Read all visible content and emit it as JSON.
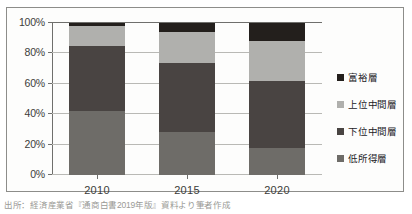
{
  "chart_data": {
    "type": "bar",
    "subtype": "stacked-100-percent",
    "title": "",
    "xlabel": "",
    "ylabel": "",
    "categories": [
      "2010",
      "2015",
      "2020"
    ],
    "series": [
      {
        "name": "低所得層",
        "values": [
          42,
          28,
          18
        ],
        "color": "#6e6c68"
      },
      {
        "name": "下位中間層",
        "values": [
          43,
          46,
          44
        ],
        "color": "#494442"
      },
      {
        "name": "上位中間層",
        "values": [
          13,
          20,
          26
        ],
        "color": "#b0b0ad"
      },
      {
        "name": "富裕層",
        "values": [
          2,
          6,
          12
        ],
        "color": "#231f1c"
      }
    ],
    "stack_order_bottom_to_top": [
      "低所得層",
      "下位中間層",
      "上位中間層",
      "富裕層"
    ],
    "ylim": [
      0,
      100
    ],
    "yticks": [
      0,
      20,
      40,
      60,
      80,
      100
    ],
    "ytick_labels": [
      "0%",
      "20%",
      "40%",
      "60%",
      "80%",
      "100%"
    ],
    "grid": true,
    "legend_position": "right",
    "legend_order_top_to_bottom": [
      "富裕層",
      "上位中間層",
      "下位中間層",
      "低所得層"
    ]
  },
  "axis": {
    "y_ticks": [
      {
        "value": 100,
        "label": "100%"
      },
      {
        "value": 80,
        "label": "80%"
      },
      {
        "value": 60,
        "label": "60%"
      },
      {
        "value": 40,
        "label": "40%"
      },
      {
        "value": 20,
        "label": "20%"
      },
      {
        "value": 0,
        "label": "0%"
      }
    ],
    "x_ticks": [
      {
        "label": "2010"
      },
      {
        "label": "2015"
      },
      {
        "label": "2020"
      }
    ]
  },
  "bars": [
    {
      "category": "2010",
      "segments": [
        {
          "name": "富裕層",
          "value": 2,
          "color": "#231f1c"
        },
        {
          "name": "上位中間層",
          "value": 13,
          "color": "#b0b0ad"
        },
        {
          "name": "下位中間層",
          "value": 43,
          "color": "#494442"
        },
        {
          "name": "低所得層",
          "value": 42,
          "color": "#6e6c68"
        }
      ]
    },
    {
      "category": "2015",
      "segments": [
        {
          "name": "富裕層",
          "value": 6,
          "color": "#231f1c"
        },
        {
          "name": "上位中間層",
          "value": 20,
          "color": "#b0b0ad"
        },
        {
          "name": "下位中間層",
          "value": 46,
          "color": "#494442"
        },
        {
          "name": "低所得層",
          "value": 28,
          "color": "#6e6c68"
        }
      ]
    },
    {
      "category": "2020",
      "segments": [
        {
          "name": "富裕層",
          "value": 12,
          "color": "#231f1c"
        },
        {
          "name": "上位中間層",
          "value": 26,
          "color": "#b0b0ad"
        },
        {
          "name": "下位中間層",
          "value": 44,
          "color": "#494442"
        },
        {
          "name": "低所得層",
          "value": 18,
          "color": "#6e6c68"
        }
      ]
    }
  ],
  "legend": {
    "items": [
      {
        "label": "富裕層",
        "color": "#231f1c"
      },
      {
        "label": "上位中間層",
        "color": "#b0b0ad"
      },
      {
        "label": "下位中間層",
        "color": "#494442"
      },
      {
        "label": "低所得層",
        "color": "#6e6c68"
      }
    ]
  },
  "source": {
    "text": "出所：経済産業省『通商白書2019年版』資料より筆者作成"
  }
}
